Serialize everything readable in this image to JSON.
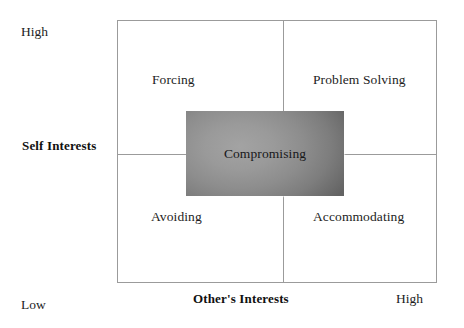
{
  "diagram": {
    "type": "two-by-two-matrix",
    "frame_color": "#9b9b9b",
    "background_color": "#ffffff",
    "text_color": "#1d1d1d"
  },
  "axes": {
    "y_axis": {
      "title": "Self Interests",
      "high_label": "High",
      "low_label": "Low"
    },
    "x_axis": {
      "title": "Other's Interests",
      "high_label": "High"
    }
  },
  "quadrants": {
    "top_left": "Forcing",
    "top_right": "Problem Solving",
    "bottom_left": "Avoiding",
    "bottom_right": "Accommodating"
  },
  "center": {
    "label": "Compromising",
    "fill_light": "#a3a3a3",
    "fill_dark": "#636363"
  },
  "chart_data": {
    "type": "scatter",
    "xlabel": "Other's Interests",
    "ylabel": "Self Interests",
    "xlim": [
      0,
      1
    ],
    "ylim": [
      0,
      1
    ],
    "xtick_labels": [
      "",
      "High"
    ],
    "ytick_labels": [
      "Low",
      "High"
    ],
    "grid": false,
    "legend": "none",
    "annotations": [
      {
        "text": "Forcing",
        "x": 0.25,
        "y": 0.78,
        "quadrant": "top-left"
      },
      {
        "text": "Problem Solving",
        "x": 0.75,
        "y": 0.78,
        "quadrant": "top-right"
      },
      {
        "text": "Avoiding",
        "x": 0.25,
        "y": 0.26,
        "quadrant": "bottom-left"
      },
      {
        "text": "Accommodating",
        "x": 0.75,
        "y": 0.26,
        "quadrant": "bottom-right"
      },
      {
        "text": "Compromising",
        "x": 0.5,
        "y": 0.5,
        "quadrant": "center"
      }
    ]
  }
}
